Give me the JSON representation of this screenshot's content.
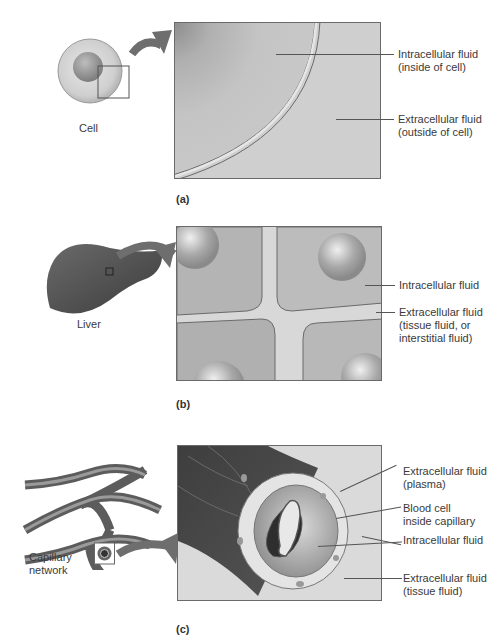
{
  "figure": {
    "panels": [
      {
        "id": "a",
        "panel_label": "(a)",
        "source_label": "Cell",
        "labels": [
          {
            "line1": "Intracellular fluid",
            "line2": "(inside of cell)"
          },
          {
            "line1": "Extracellular fluid",
            "line2": "(outside of cell)"
          }
        ]
      },
      {
        "id": "b",
        "panel_label": "(b)",
        "source_label": "Liver",
        "labels": [
          {
            "line1": "Intracellular fluid"
          },
          {
            "line1": "Extracellular fluid",
            "line2": "(tissue fluid, or",
            "line3": "interstitial fluid)"
          }
        ]
      },
      {
        "id": "c",
        "panel_label": "(c)",
        "source_label_line1": "Capillary",
        "source_label_line2": "network",
        "labels": [
          {
            "line1": "Extracellular fluid",
            "line2": "(plasma)"
          },
          {
            "line1": "Blood cell",
            "line2": "inside capillary"
          },
          {
            "line1": "Intracellular fluid"
          },
          {
            "line1": "Extracellular fluid",
            "line2": "(tissue fluid)"
          }
        ]
      }
    ],
    "colors": {
      "background": "#ffffff",
      "panel_fill": "#c8c8c8",
      "dark_tissue": "#5a5a5a",
      "arrow": "#6e6e6e",
      "text": "#3a3a3a"
    }
  }
}
